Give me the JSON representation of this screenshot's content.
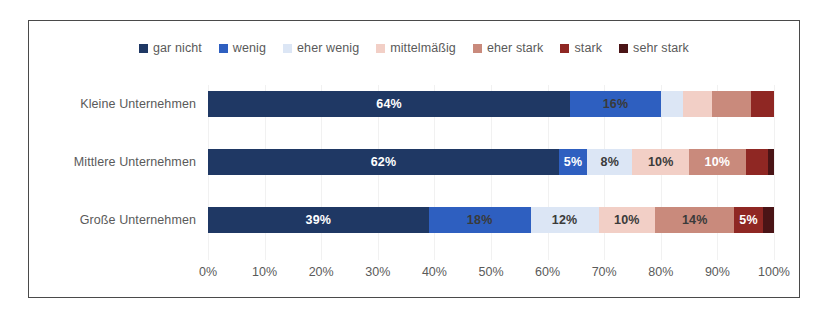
{
  "chart_data": {
    "type": "bar",
    "subtype": "stacked-horizontal-100",
    "title": "",
    "xlabel": "",
    "ylabel": "",
    "xlim": [
      0,
      100
    ],
    "grid": true,
    "legend_position": "top",
    "categories": [
      "Kleine Unternehmen",
      "Mittlere Unternehmen",
      "Große Unternehmen"
    ],
    "series": [
      {
        "name": "gar nicht",
        "color": "#1f3864",
        "values": [
          64,
          62,
          39
        ]
      },
      {
        "name": "wenig",
        "color": "#2e5fc0",
        "values": [
          16,
          5,
          18
        ]
      },
      {
        "name": "eher wenig",
        "color": "#dce6f5",
        "values": [
          4,
          8,
          12
        ]
      },
      {
        "name": "mittelmäßig",
        "color": "#f2cfc6",
        "values": [
          5,
          10,
          10
        ]
      },
      {
        "name": "eher stark",
        "color": "#c98a7c",
        "values": [
          7,
          10,
          14
        ]
      },
      {
        "name": "stark",
        "color": "#8f2723",
        "values": [
          4,
          4,
          5
        ]
      },
      {
        "name": "sehr stark",
        "color": "#4a1416",
        "values": [
          0,
          1,
          2
        ]
      }
    ],
    "xticks": [
      "0%",
      "10%",
      "20%",
      "30%",
      "40%",
      "50%",
      "60%",
      "70%",
      "80%",
      "90%",
      "100%"
    ],
    "xtick_values": [
      0,
      10,
      20,
      30,
      40,
      50,
      60,
      70,
      80,
      90,
      100
    ],
    "visible_data_labels": {
      "Kleine Unternehmen": [
        "64%",
        "16%",
        "",
        "",
        "",
        "",
        ""
      ],
      "Mittlere Unternehmen": [
        "62%",
        "5%",
        "8%",
        "10%",
        "10%",
        "",
        ""
      ],
      "Große Unternehmen": [
        "39%",
        "18%",
        "12%",
        "10%",
        "14%",
        "5%",
        ""
      ]
    }
  },
  "legend": {
    "items": [
      {
        "label": "gar nicht",
        "color": "#1f3864"
      },
      {
        "label": "wenig",
        "color": "#2e5fc0"
      },
      {
        "label": "eher wenig",
        "color": "#dce6f5"
      },
      {
        "label": "mittelmäßig",
        "color": "#f2cfc6"
      },
      {
        "label": "eher stark",
        "color": "#c98a7c"
      },
      {
        "label": "stark",
        "color": "#8f2723"
      },
      {
        "label": "sehr stark",
        "color": "#4a1416"
      }
    ]
  },
  "axis": {
    "ticks": [
      "0%",
      "10%",
      "20%",
      "30%",
      "40%",
      "50%",
      "60%",
      "70%",
      "80%",
      "90%",
      "100%"
    ]
  },
  "rows": [
    {
      "label": "Kleine Unternehmen",
      "segments": [
        {
          "series": "gar nicht",
          "value": 64,
          "text": "64%",
          "text_color": "light"
        },
        {
          "series": "wenig",
          "value": 16,
          "text": "16%",
          "text_color": "dark"
        },
        {
          "series": "eher wenig",
          "value": 4,
          "text": "",
          "text_color": "dark"
        },
        {
          "series": "mittelmäßig",
          "value": 5,
          "text": "",
          "text_color": "dark"
        },
        {
          "series": "eher stark",
          "value": 7,
          "text": "",
          "text_color": "dark"
        },
        {
          "series": "stark",
          "value": 4,
          "text": "",
          "text_color": "light"
        },
        {
          "series": "sehr stark",
          "value": 0,
          "text": "",
          "text_color": "light"
        }
      ]
    },
    {
      "label": "Mittlere Unternehmen",
      "segments": [
        {
          "series": "gar nicht",
          "value": 62,
          "text": "62%",
          "text_color": "light"
        },
        {
          "series": "wenig",
          "value": 5,
          "text": "5%",
          "text_color": "light"
        },
        {
          "series": "eher wenig",
          "value": 8,
          "text": "8%",
          "text_color": "dark"
        },
        {
          "series": "mittelmäßig",
          "value": 10,
          "text": "10%",
          "text_color": "dark"
        },
        {
          "series": "eher stark",
          "value": 10,
          "text": "10%",
          "text_color": "light"
        },
        {
          "series": "stark",
          "value": 4,
          "text": "",
          "text_color": "light"
        },
        {
          "series": "sehr stark",
          "value": 1,
          "text": "",
          "text_color": "light"
        }
      ]
    },
    {
      "label": "Große Unternehmen",
      "segments": [
        {
          "series": "gar nicht",
          "value": 39,
          "text": "39%",
          "text_color": "light"
        },
        {
          "series": "wenig",
          "value": 18,
          "text": "18%",
          "text_color": "dark"
        },
        {
          "series": "eher wenig",
          "value": 12,
          "text": "12%",
          "text_color": "dark"
        },
        {
          "series": "mittelmäßig",
          "value": 10,
          "text": "10%",
          "text_color": "dark"
        },
        {
          "series": "eher stark",
          "value": 14,
          "text": "14%",
          "text_color": "dark"
        },
        {
          "series": "stark",
          "value": 5,
          "text": "5%",
          "text_color": "light"
        },
        {
          "series": "sehr stark",
          "value": 2,
          "text": "",
          "text_color": "light"
        }
      ]
    }
  ]
}
